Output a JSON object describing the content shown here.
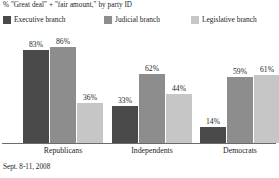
{
  "chart_data": {
    "type": "bar",
    "title": "% \"Great deal\" + \"fair amount,\" by party ID",
    "xlabel": "",
    "ylabel": "",
    "ylim": [
      0,
      100
    ],
    "grid": false,
    "legend_position": "top",
    "categories": [
      "Republicans",
      "Independents",
      "Democrats"
    ],
    "series": [
      {
        "name": "Executive branch",
        "color": "#4a4a4a",
        "values": [
          83,
          86,
          36
        ],
        "labels": [
          "83%",
          "86%",
          "36%"
        ]
      },
      {
        "name": "Judicial branch",
        "color": "#8d8d8d",
        "values": [
          33,
          62,
          44
        ],
        "labels": [
          "33%",
          "62%",
          "44%"
        ]
      },
      {
        "name": "Legislative branch",
        "color": "#c6c6c6",
        "values": [
          14,
          59,
          61
        ],
        "labels": [
          "14%",
          "59%",
          "61%"
        ]
      }
    ],
    "groups": [
      {
        "category": "Republicans",
        "bars": [
          {
            "series": "Executive branch",
            "value": 83,
            "label": "83%",
            "color": "#4a4a4a"
          },
          {
            "series": "Judicial branch",
            "value": 86,
            "label": "86%",
            "color": "#8d8d8d"
          },
          {
            "series": "Legislative branch",
            "value": 36,
            "label": "36%",
            "color": "#c6c6c6"
          }
        ]
      },
      {
        "category": "Independents",
        "bars": [
          {
            "series": "Executive branch",
            "value": 33,
            "label": "33%",
            "color": "#4a4a4a"
          },
          {
            "series": "Judicial branch",
            "value": 62,
            "label": "62%",
            "color": "#8d8d8d"
          },
          {
            "series": "Legislative branch",
            "value": 44,
            "label": "44%",
            "color": "#c6c6c6"
          }
        ]
      },
      {
        "category": "Democrats",
        "bars": [
          {
            "series": "Executive branch",
            "value": 14,
            "label": "14%",
            "color": "#4a4a4a"
          },
          {
            "series": "Judicial branch",
            "value": 59,
            "label": "59%",
            "color": "#8d8d8d"
          },
          {
            "series": "Legislative branch",
            "value": 61,
            "label": "61%",
            "color": "#c6c6c6"
          }
        ]
      }
    ],
    "footnote": "Sept. 8-11, 2008"
  }
}
